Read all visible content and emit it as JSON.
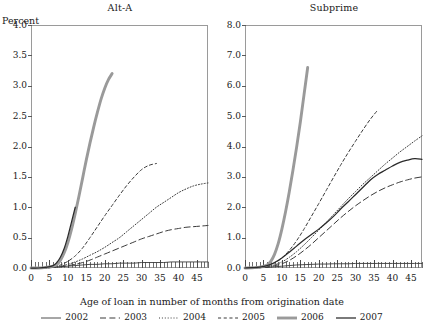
{
  "figure": {
    "xlabel": "Age of loan in number of months from origination date",
    "y_unit_label": "Percent"
  },
  "panels": [
    {
      "title": "Alt-A",
      "ylim": [
        0.0,
        4.0
      ],
      "yticks": [
        "0.0",
        "0.5",
        "1.0",
        "1.5",
        "2.0",
        "2.5",
        "3.0",
        "3.5",
        "4.0"
      ],
      "xlim": [
        0,
        48
      ],
      "xticks": [
        "0",
        "5",
        "10",
        "15",
        "20",
        "25",
        "30",
        "35",
        "40",
        "45"
      ]
    },
    {
      "title": "Subprime",
      "ylim": [
        0.0,
        8.0
      ],
      "yticks": [
        "0.0",
        "1.0",
        "2.0",
        "3.0",
        "4.0",
        "5.0",
        "6.0",
        "7.0",
        "8.0"
      ],
      "xlim": [
        0,
        48
      ],
      "xticks": [
        "0",
        "5",
        "10",
        "15",
        "20",
        "25",
        "30",
        "35",
        "40",
        "45"
      ]
    }
  ],
  "legend": {
    "items": [
      {
        "label": "2002",
        "style": "solid-thin",
        "color": "#3a3a3a"
      },
      {
        "label": "2003",
        "style": "long-dash",
        "color": "#3a3a3a"
      },
      {
        "label": "2004",
        "style": "dotted",
        "color": "#3a3a3a"
      },
      {
        "label": "2005",
        "style": "short-dash",
        "color": "#3a3a3a"
      },
      {
        "label": "2006",
        "style": "solid-thick",
        "color": "#9a9a9a"
      },
      {
        "label": "2007",
        "style": "solid-med",
        "color": "#2a2a2a"
      }
    ]
  },
  "chart_data": {
    "type": "line",
    "xlabel": "Age of loan in number of months from origination date",
    "ylabel": "Percent",
    "panels": [
      {
        "name": "Alt-A",
        "ylim": [
          0.0,
          4.0
        ],
        "xlim": [
          0,
          48
        ],
        "grid": false,
        "series": [
          {
            "name": "2002",
            "style": "solid-thin",
            "color": "#3a3a3a",
            "x": [
              0,
              2,
              4,
              6,
              8,
              10,
              12,
              14,
              16,
              18,
              20,
              22,
              24,
              26,
              28,
              30,
              32,
              34,
              36,
              38,
              40,
              42,
              44,
              46,
              48
            ],
            "y": [
              0.0,
              0.0,
              0.0,
              0.01,
              0.02,
              0.03,
              0.04,
              0.05,
              0.06,
              0.06,
              0.07,
              0.07,
              0.08,
              0.08,
              0.08,
              0.09,
              0.09,
              0.09,
              0.09,
              0.1,
              0.1,
              0.1,
              0.1,
              0.1,
              0.1
            ]
          },
          {
            "name": "2003",
            "style": "long-dash",
            "color": "#3a3a3a",
            "x": [
              0,
              2,
              4,
              6,
              8,
              10,
              12,
              14,
              16,
              18,
              20,
              22,
              24,
              26,
              28,
              30,
              32,
              34,
              36,
              38,
              40,
              42,
              44,
              46,
              48
            ],
            "y": [
              0.0,
              0.0,
              0.0,
              0.01,
              0.02,
              0.04,
              0.06,
              0.09,
              0.13,
              0.18,
              0.23,
              0.28,
              0.33,
              0.38,
              0.43,
              0.48,
              0.52,
              0.56,
              0.6,
              0.63,
              0.65,
              0.67,
              0.68,
              0.69,
              0.7
            ]
          },
          {
            "name": "2004",
            "style": "dotted",
            "color": "#3a3a3a",
            "x": [
              0,
              2,
              4,
              6,
              8,
              10,
              12,
              14,
              16,
              18,
              20,
              22,
              24,
              26,
              28,
              30,
              32,
              34,
              36,
              38,
              40,
              42,
              44,
              46,
              48
            ],
            "y": [
              0.0,
              0.0,
              0.0,
              0.01,
              0.03,
              0.06,
              0.1,
              0.15,
              0.21,
              0.27,
              0.34,
              0.42,
              0.5,
              0.6,
              0.7,
              0.8,
              0.9,
              1.0,
              1.08,
              1.16,
              1.24,
              1.3,
              1.35,
              1.38,
              1.4
            ]
          },
          {
            "name": "2005",
            "style": "short-dash",
            "color": "#3a3a3a",
            "x": [
              0,
              2,
              4,
              6,
              8,
              10,
              12,
              14,
              16,
              18,
              20,
              22,
              24,
              26,
              28,
              30,
              32,
              34
            ],
            "y": [
              0.0,
              0.0,
              0.01,
              0.02,
              0.05,
              0.11,
              0.2,
              0.33,
              0.5,
              0.68,
              0.86,
              1.03,
              1.2,
              1.36,
              1.5,
              1.62,
              1.69,
              1.72
            ]
          },
          {
            "name": "2006",
            "style": "solid-thick",
            "color": "#9a9a9a",
            "x": [
              0,
              2,
              4,
              6,
              7,
              8,
              9,
              10,
              11,
              12,
              13,
              14,
              15,
              16,
              17,
              18,
              19,
              20,
              21,
              22
            ],
            "y": [
              0.0,
              0.0,
              0.01,
              0.03,
              0.06,
              0.13,
              0.25,
              0.42,
              0.64,
              0.9,
              1.18,
              1.48,
              1.78,
              2.06,
              2.32,
              2.56,
              2.78,
              2.96,
              3.1,
              3.2
            ]
          },
          {
            "name": "2007",
            "style": "solid-med",
            "color": "#2a2a2a",
            "x": [
              0,
              2,
              4,
              6,
              7,
              8,
              9,
              10,
              11,
              12
            ],
            "y": [
              0.0,
              0.0,
              0.01,
              0.04,
              0.09,
              0.18,
              0.32,
              0.52,
              0.76,
              1.0
            ]
          }
        ]
      },
      {
        "name": "Subprime",
        "ylim": [
          0.0,
          8.0
        ],
        "xlim": [
          0,
          48
        ],
        "grid": false,
        "series": [
          {
            "name": "2002",
            "style": "solid-thin",
            "color": "#3a3a3a",
            "x": [
              0,
              2,
              4,
              6,
              8,
              10,
              12,
              14,
              16,
              18,
              20,
              22,
              24,
              26,
              28,
              30,
              32,
              34,
              36,
              38,
              40,
              42,
              44,
              46,
              48
            ],
            "y": [
              0.0,
              0.0,
              0.01,
              0.02,
              0.04,
              0.06,
              0.08,
              0.1,
              0.11,
              0.12,
              0.13,
              0.13,
              0.14,
              0.14,
              0.14,
              0.15,
              0.15,
              0.15,
              0.15,
              0.15,
              0.15,
              0.15,
              0.15,
              0.15,
              0.15
            ]
          },
          {
            "name": "2003",
            "style": "long-dash",
            "color": "#3a3a3a",
            "x": [
              0,
              2,
              4,
              6,
              8,
              10,
              12,
              14,
              16,
              18,
              20,
              22,
              24,
              26,
              28,
              30,
              32,
              34,
              36,
              38,
              40,
              42,
              44,
              46,
              48
            ],
            "y": [
              0.0,
              0.0,
              0.01,
              0.03,
              0.07,
              0.14,
              0.25,
              0.4,
              0.58,
              0.78,
              1.0,
              1.22,
              1.44,
              1.66,
              1.86,
              2.05,
              2.22,
              2.38,
              2.52,
              2.64,
              2.74,
              2.83,
              2.9,
              2.96,
              3.0
            ]
          },
          {
            "name": "2004",
            "style": "dotted",
            "color": "#3a3a3a",
            "x": [
              0,
              2,
              4,
              6,
              8,
              10,
              12,
              14,
              16,
              18,
              20,
              22,
              24,
              26,
              28,
              30,
              32,
              34,
              36,
              38,
              40,
              42,
              44,
              46,
              48
            ],
            "y": [
              0.0,
              0.0,
              0.01,
              0.04,
              0.1,
              0.2,
              0.35,
              0.54,
              0.76,
              1.0,
              1.25,
              1.5,
              1.76,
              2.02,
              2.28,
              2.52,
              2.76,
              2.98,
              3.2,
              3.42,
              3.62,
              3.82,
              4.0,
              4.18,
              4.35
            ]
          },
          {
            "name": "2005",
            "style": "short-dash",
            "color": "#3a3a3a",
            "x": [
              0,
              2,
              4,
              6,
              8,
              10,
              12,
              14,
              16,
              18,
              20,
              22,
              24,
              26,
              28,
              30,
              32,
              34,
              36
            ],
            "y": [
              0.0,
              0.01,
              0.02,
              0.06,
              0.16,
              0.33,
              0.58,
              0.9,
              1.28,
              1.7,
              2.12,
              2.55,
              2.98,
              3.4,
              3.8,
              4.18,
              4.55,
              4.9,
              5.2
            ]
          },
          {
            "name": "2006",
            "style": "solid-thick",
            "color": "#9a9a9a",
            "x": [
              0,
              2,
              4,
              6,
              7,
              8,
              9,
              10,
              11,
              12,
              13,
              14,
              15,
              16,
              17
            ],
            "y": [
              0.0,
              0.01,
              0.03,
              0.1,
              0.22,
              0.45,
              0.8,
              1.28,
              1.85,
              2.5,
              3.22,
              3.98,
              4.8,
              5.7,
              6.6
            ]
          },
          {
            "name": "2007",
            "style": "solid-med",
            "color": "#2a2a2a",
            "x": [
              0,
              2,
              4,
              6,
              8,
              10,
              12,
              14,
              16,
              18,
              20,
              22,
              24,
              26,
              28,
              30,
              32,
              34,
              36,
              38,
              40,
              42,
              44,
              46,
              48
            ],
            "y": [
              0.0,
              0.01,
              0.03,
              0.08,
              0.18,
              0.33,
              0.52,
              0.72,
              0.92,
              1.1,
              1.28,
              1.48,
              1.7,
              1.95,
              2.18,
              2.42,
              2.66,
              2.9,
              3.08,
              3.22,
              3.36,
              3.48,
              3.55,
              3.6,
              3.58
            ]
          }
        ]
      }
    ]
  }
}
